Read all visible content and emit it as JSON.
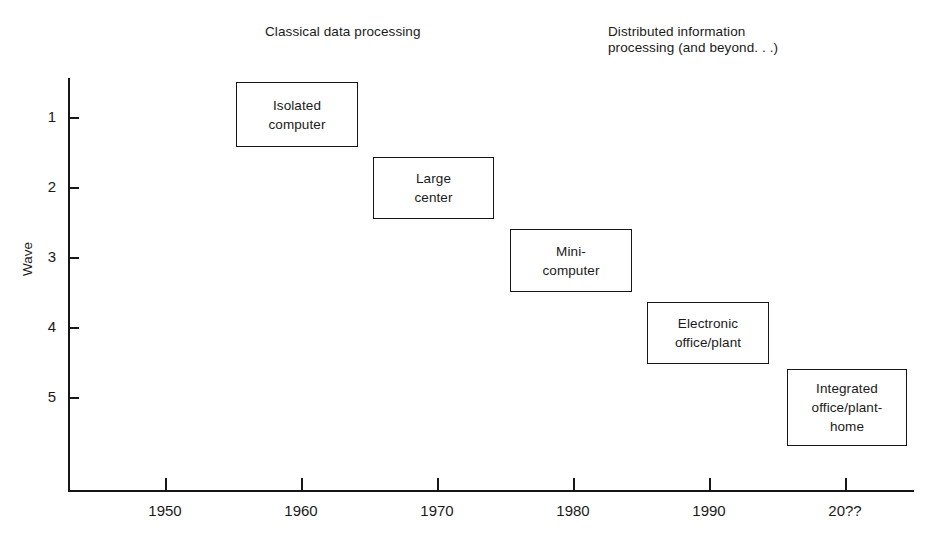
{
  "figure": {
    "headers": [
      {
        "id": "classical",
        "text": "Classical data processing"
      },
      {
        "id": "distributed",
        "text": "Distributed information\nprocessing (and beyond. . .)"
      }
    ],
    "y_axis_title": "Wave",
    "ink_color": "#161616"
  },
  "chart_data": {
    "type": "bar",
    "title": "",
    "subtitle": "",
    "xlabel": "",
    "ylabel": "Wave",
    "grid": false,
    "legend_position": "none",
    "x_tick_labels": [
      "1950",
      "1960",
      "1970",
      "1980",
      "1990",
      "20??"
    ],
    "y_tick_labels": [
      "1",
      "2",
      "3",
      "4",
      "5"
    ],
    "xlim": [
      1943,
      2005
    ],
    "ylim": [
      0.3,
      6.2
    ],
    "y_axis_inverted": true,
    "annotations": [
      {
        "text": "Classical data processing",
        "x": 1957,
        "y": 0.0
      },
      {
        "text": "Distributed information processing (and beyond. . .)",
        "x": 1982,
        "y": 0.0
      }
    ],
    "categories": [
      "Isolated computer",
      "Large center",
      "Mini-computer",
      "Electronic office/plant",
      "Integrated office/plant-home"
    ],
    "values": [
      1,
      2,
      3,
      4,
      5
    ],
    "boxes": [
      {
        "label": "Isolated\ncomputer",
        "wave": 1,
        "x_start": 1955,
        "x_end": 1964,
        "left": 236,
        "top": 82,
        "width": 122,
        "height": 65
      },
      {
        "label": "Large\ncenter",
        "wave": 2,
        "x_start": 1965,
        "x_end": 1974,
        "left": 373,
        "top": 157,
        "width": 121,
        "height": 62
      },
      {
        "label": "Mini-\ncomputer",
        "wave": 3,
        "x_start": 1975,
        "x_end": 1984,
        "left": 510,
        "top": 229,
        "width": 122,
        "height": 63
      },
      {
        "label": "Electronic\noffice/plant",
        "wave": 4,
        "x_start": 1985,
        "x_end": 1994,
        "left": 647,
        "top": 302,
        "width": 122,
        "height": 62
      },
      {
        "label": "Integrated\noffice/plant-\nhome",
        "wave": 5,
        "x_start": 1995,
        "x_end": 2004,
        "left": 787,
        "top": 369,
        "width": 120,
        "height": 77
      }
    ],
    "y_tick_positions_px": [
      117,
      187,
      257,
      327,
      397
    ],
    "x_tick_positions_px": [
      165,
      301,
      437,
      573,
      709,
      845
    ]
  }
}
